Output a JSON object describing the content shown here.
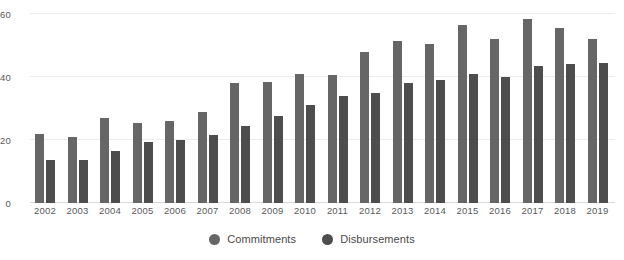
{
  "chart_data": {
    "type": "bar",
    "title": "",
    "subtitle": "",
    "xlabel": "",
    "ylabel": "",
    "ylim": [
      0,
      60
    ],
    "yticks": [
      0,
      20,
      40,
      60
    ],
    "grid": true,
    "legend_position": "bottom-center",
    "categories": [
      "2002",
      "2003",
      "2004",
      "2005",
      "2006",
      "2007",
      "2008",
      "2009",
      "2010",
      "2011",
      "2012",
      "2013",
      "2014",
      "2015",
      "2016",
      "2017",
      "2018",
      "2019"
    ],
    "series": [
      {
        "name": "Commitments",
        "color": "#666666",
        "values": [
          22,
          21,
          27,
          25.5,
          26,
          29,
          38,
          38.5,
          41,
          40.5,
          48,
          51.5,
          50.5,
          56.5,
          52,
          58.5,
          55.5,
          52
        ]
      },
      {
        "name": "Disbursements",
        "color": "#4d4d4d",
        "values": [
          13.5,
          13.5,
          16.5,
          19.5,
          20,
          21.5,
          24.5,
          27.5,
          31,
          34,
          35,
          38,
          39,
          41,
          40,
          43.5,
          44,
          44.5
        ]
      }
    ]
  },
  "axis": {
    "y_tick_labels": [
      "60",
      "40",
      "20",
      "0"
    ]
  },
  "legend": {
    "items": [
      {
        "label": "Commitments",
        "marker": "circle-marker",
        "color": "#666666"
      },
      {
        "label": "Disbursements",
        "marker": "circle-marker",
        "color": "#4d4d4d"
      }
    ]
  },
  "colors": {
    "commitments": "#666666",
    "disbursements": "#4d4d4d",
    "gridline": "#ececec",
    "baseline": "#d9d9d9",
    "text": "#58595b",
    "background": "#ffffff"
  }
}
